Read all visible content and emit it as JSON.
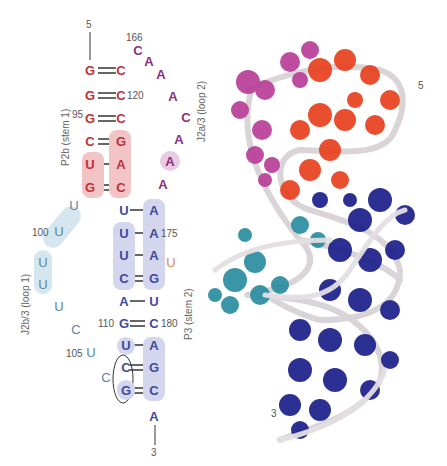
{
  "colors": {
    "p2b": "#c0303a",
    "j2a3": "#8a2f7a",
    "p3": "#3e4aa0",
    "j2b3": "#5a86a0",
    "bulge_u": "#e08a3a",
    "p2b_highlight": "#f2c4c6",
    "p3_highlight": "#d4d6ee",
    "j2b3_highlight": "#d6e6ee",
    "j2a3_highlight": "#e8cbe3",
    "model_red": "#e8411e",
    "model_magenta": "#b83a96",
    "model_navy": "#1c1f8a",
    "model_teal": "#2a8ea0",
    "backbone": "#d9d4d8"
  },
  "labels": {
    "p2b": "P2b (stem 1)",
    "j2a3": "J2a/3 (loop 2)",
    "j2b3": "J2b/3 (loop 1)",
    "p3": "P3 (stem 2)",
    "five_prime": "5",
    "three_prime": "3",
    "model_five_prime": "5",
    "model_three_prime": "3"
  },
  "numbers": {
    "n95": "95",
    "n100": "100",
    "n105": "105",
    "n110": "110",
    "n120": "120",
    "n166": "166",
    "n175": "175",
    "n180": "180"
  },
  "stem_p2b": [
    {
      "left": "G",
      "right": "C",
      "bond": "double"
    },
    {
      "left": "G",
      "right": "C",
      "bond": "double"
    },
    {
      "left": "G",
      "right": "C",
      "bond": "double"
    },
    {
      "left": "C",
      "right": "G",
      "bond": "double"
    },
    {
      "left": "U",
      "right": "A",
      "bond": "single"
    },
    {
      "left": "G",
      "right": "C",
      "bond": "double"
    }
  ],
  "loop_j2a3": [
    "C",
    "A",
    "A",
    "A",
    "C",
    "A",
    "A",
    "A"
  ],
  "stem_p3": [
    {
      "left": "U",
      "right": "A",
      "bond": "single"
    },
    {
      "left": "U",
      "right": "A",
      "bond": "single"
    },
    {
      "left": "U",
      "right": "A",
      "bond": "single"
    },
    {
      "left": "C",
      "right": "G",
      "bond": "double"
    },
    {
      "left": "A",
      "right": "U",
      "bond": "single"
    },
    {
      "left": "G",
      "right": "C",
      "bond": "double"
    },
    {
      "left": "U",
      "right": "A",
      "bond": "single"
    },
    {
      "left": "C",
      "right": "G",
      "bond": "double"
    },
    {
      "left": "G",
      "right": "C",
      "bond": "double"
    }
  ],
  "bulge": "U",
  "loop_j2b3": [
    "U",
    "U",
    "U",
    "U",
    "U",
    "C",
    "U",
    "C"
  ],
  "tail_3prime": "A"
}
